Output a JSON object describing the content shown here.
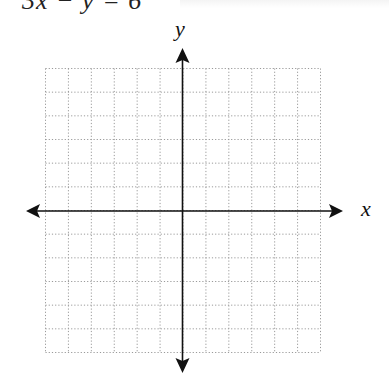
{
  "equation": {
    "text": "3x − y = 6",
    "cropped": true
  },
  "graph": {
    "x_label": "x",
    "y_label": "y",
    "grid": {
      "columns": 12,
      "rows": 12,
      "style": "dotted",
      "color": "#9a9a9a"
    },
    "axis_color": "#111111",
    "x_range": [
      -6,
      6
    ],
    "y_range": [
      -6,
      6
    ]
  }
}
